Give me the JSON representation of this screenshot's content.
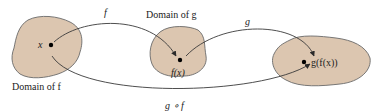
{
  "diagram": {
    "colors": {
      "region_fill": "#dcc6b0",
      "region_stroke": "#6a6a6a",
      "arrow": "#3a3a3a",
      "text": "#222222"
    },
    "regions": [
      {
        "id": "domain-f",
        "label": "Domain of f",
        "point_label": "x"
      },
      {
        "id": "domain-g",
        "label": "Domain of g",
        "point_label": "f(x)"
      },
      {
        "id": "range",
        "label": "",
        "point_label": "g(f(x))"
      }
    ],
    "arrows": [
      {
        "from": "x",
        "to": "f(x)",
        "label": "f"
      },
      {
        "from": "f(x)",
        "to": "g(f(x))",
        "label": "g"
      },
      {
        "from": "x",
        "to": "g(f(x))",
        "label": "g ∘ f"
      }
    ]
  }
}
